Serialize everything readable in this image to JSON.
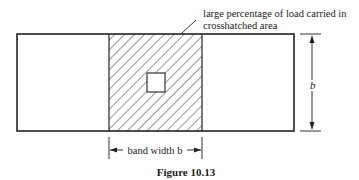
{
  "annotation": {
    "line1": "large percentage of load carried in",
    "line2": "crosshatched area"
  },
  "dimension_right": "b",
  "band_label": "band width b",
  "caption": "Figure 10.13"
}
